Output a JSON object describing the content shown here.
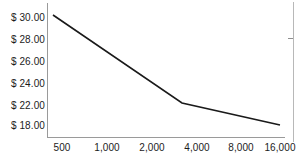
{
  "chart_data": {
    "type": "line",
    "title": "",
    "subtitle": "",
    "xlabel": "",
    "ylabel": "",
    "grid": false,
    "legend": false,
    "x_scale": "log2-category",
    "x_tick_labels": [
      "500",
      "1,000",
      "2,000",
      "4,000",
      "8,000",
      "16,000"
    ],
    "x_tick_values": [
      500,
      1000,
      2000,
      4000,
      8000,
      16000
    ],
    "y_tick_labels": [
      "$ 30.00",
      "$ 28.00",
      "$ 26.00",
      "$ 24.00",
      "$ 22.00",
      "$ 18.00"
    ],
    "y_tick_values": [
      30.0,
      28.0,
      26.0,
      24.0,
      22.0,
      18.0
    ],
    "y_axis_note": "irregular spacing: $20.00 omitted between $22.00 and $18.00",
    "ylim": [
      18.0,
      30.0
    ],
    "series": [
      {
        "name": "Unit price",
        "color": "#1a1a1a",
        "x": [
          500,
          3400,
          16000
        ],
        "values": [
          30.3,
          22.2,
          18.3
        ],
        "points_px": [
          {
            "x": 53,
            "y": 15
          },
          {
            "x": 182,
            "y": 103
          },
          {
            "x": 280,
            "y": 125
          }
        ]
      }
    ],
    "annotations": []
  },
  "axes": {
    "y_ticks": [
      {
        "label": "$ 30.00",
        "top": 13
      },
      {
        "label": "$ 28.00",
        "top": 35
      },
      {
        "label": "$ 26.00",
        "top": 57
      },
      {
        "label": "$ 24.00",
        "top": 79
      },
      {
        "label": "$ 22.00",
        "top": 101
      },
      {
        "label": "$ 18.00",
        "top": 121
      }
    ],
    "x_ticks": [
      {
        "label": "500",
        "left": 62
      },
      {
        "label": "1,000",
        "left": 107
      },
      {
        "label": "2,000",
        "left": 152
      },
      {
        "label": "4,000",
        "left": 197
      },
      {
        "label": "8,000",
        "left": 241
      },
      {
        "label": "16,000",
        "left": 280
      }
    ]
  },
  "style": {
    "axis_color": "#9a9a9a",
    "line_color": "#1a1a1a",
    "text_color": "#1c1c1c",
    "background": "#ffffff",
    "frame_color": "#b8b8b8"
  }
}
